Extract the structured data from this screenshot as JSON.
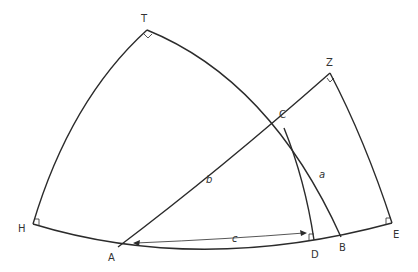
{
  "diagram": {
    "type": "spherical-triangle-construction",
    "points": {
      "T": {
        "label": "T",
        "x": 147,
        "y": 30
      },
      "Z": {
        "label": "Z",
        "x": 330,
        "y": 73
      },
      "C": {
        "label": "C",
        "x": 284,
        "y": 128
      },
      "H": {
        "label": "H",
        "x": 33,
        "y": 224
      },
      "A": {
        "label": "A",
        "x": 118,
        "y": 247
      },
      "D": {
        "label": "D",
        "x": 314,
        "y": 240
      },
      "B": {
        "label": "B",
        "x": 341,
        "y": 237
      },
      "E": {
        "label": "E",
        "x": 392,
        "y": 223
      }
    },
    "sides": {
      "a": "a",
      "b": "b",
      "c": "c"
    },
    "right_angles": [
      "T",
      "Z",
      "H",
      "D",
      "E"
    ],
    "stroke_color": "#2b2b2b"
  }
}
